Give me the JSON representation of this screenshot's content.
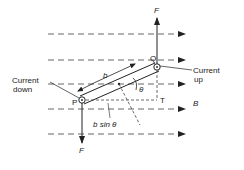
{
  "diagram": {
    "labels": {
      "force_top": "F",
      "force_bottom": "F",
      "point_q": "Q",
      "point_p": "P",
      "point_t": "T",
      "length": "b",
      "angle": "θ",
      "field": "B",
      "projection": "b sin θ",
      "current_down_1": "Current",
      "current_down_2": "down",
      "current_up_1": "Current",
      "current_up_2": "up"
    },
    "colors": {
      "ink": "#222222",
      "background": "#ffffff"
    }
  }
}
